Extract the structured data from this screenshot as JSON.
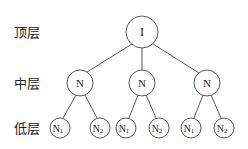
{
  "layers": {
    "top": "顶层",
    "middle": "中层",
    "bottom": "低层"
  },
  "nodes": {
    "root": "I",
    "mid": [
      "N",
      "N",
      "N"
    ],
    "leaf": [
      {
        "base": "N",
        "sub": "1"
      },
      {
        "base": "N",
        "sub": "2"
      },
      {
        "base": "N",
        "sub": "1"
      },
      {
        "base": "N",
        "sub": "2"
      },
      {
        "base": "N",
        "sub": "1"
      },
      {
        "base": "N",
        "sub": "2"
      }
    ]
  }
}
